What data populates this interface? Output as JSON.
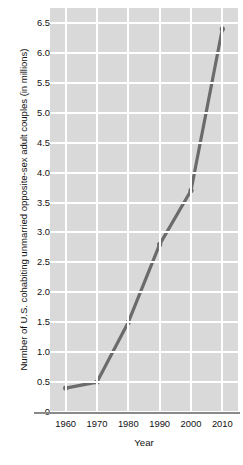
{
  "chart_data": {
    "type": "line",
    "title": "",
    "subtitle": "",
    "xlabel": "Year",
    "ylabel": "Number of U.S. cohabiting unmarried opposite-sex adult couples (in millions)",
    "x": [
      1960,
      1970,
      1980,
      1990,
      2000,
      2010
    ],
    "values": [
      0.4,
      0.5,
      1.5,
      2.8,
      3.7,
      6.4
    ],
    "series": [
      {
        "name": "Cohabiting unmarried opposite-sex adult couples",
        "values": [
          0.4,
          0.5,
          1.5,
          2.8,
          3.7,
          6.4
        ]
      }
    ],
    "xlim": [
      1955,
      2015
    ],
    "ylim": [
      0,
      6.75
    ],
    "x_tick_labels": [
      "1960",
      "1970",
      "1980",
      "1990",
      "2000",
      "2010"
    ],
    "y_tick_labels": [
      "0",
      "0.5",
      "1.0",
      "1.5",
      "2.0",
      "2.5",
      "3.0",
      "3.5",
      "4.0",
      "4.5",
      "5.0",
      "5.5",
      "6.0",
      "6.5"
    ],
    "y_tick_values": [
      0,
      0.5,
      1.0,
      1.5,
      2.0,
      2.5,
      3.0,
      3.5,
      4.0,
      4.5,
      5.0,
      5.5,
      6.0,
      6.5
    ],
    "grid": true,
    "grid_color": "#ffffff",
    "plot_background": "#d9d9d9",
    "line_color": "#6b6b6b",
    "marker": "circle",
    "legend": "none"
  },
  "axes": {
    "y_title": "Number of U.S. cohabiting unmarried opposite-sex adult couples (in millions)",
    "x_title": "Year",
    "y_ticks": [
      "6.5",
      "6.0",
      "5.5",
      "5.0",
      "4.5",
      "4.0",
      "3.5",
      "3.0",
      "2.5",
      "2.0",
      "1.5",
      "1.0",
      "0.5",
      "0"
    ],
    "x_ticks": [
      "1960",
      "1970",
      "1980",
      "1990",
      "2000",
      "2010"
    ]
  }
}
